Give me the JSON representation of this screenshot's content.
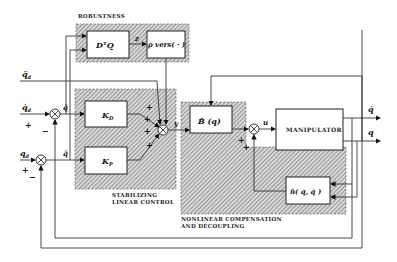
{
  "diagram": {
    "groups": {
      "robustness": "ROBUSTNESS",
      "stabilizing_1": "STABILIZING",
      "stabilizing_2": "LINEAR CONTROL",
      "nonlinear_1": "NONLINEAR COMPENSATION",
      "nonlinear_2": "AND DECOUPLING"
    },
    "blocks": {
      "dtq": "DᵀQ",
      "rho": "ρ vers( · )",
      "kd": "K",
      "kd_sub": "D",
      "kp": "K",
      "kp_sub": "P",
      "bq": "B̂ (q)",
      "manipulator": "MANIPULATOR",
      "n": "n̂( q, q̇ )"
    },
    "signals": {
      "qdd_d": "q̈",
      "qd_d": "q̇",
      "q_d": "q",
      "sub_d": "d",
      "qtilde_dot": "q̃̇",
      "qtilde": "q̃",
      "z": "z",
      "y": "y",
      "u": "u",
      "out_qdot": "q̇",
      "out_q": "q"
    },
    "signs": {
      "plus": "+",
      "minus": "−"
    }
  }
}
